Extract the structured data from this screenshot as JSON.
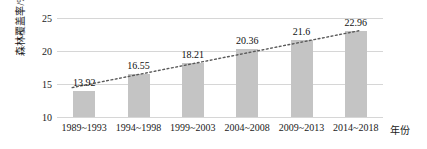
{
  "chart_data": {
    "type": "bar",
    "title": "",
    "subtitle": "",
    "xlabel": "年份",
    "ylabel": "森林覆盖率/%",
    "categories": [
      "1989~1993",
      "1994~1998",
      "1999~2003",
      "2004~2008",
      "2009~2013",
      "2014~2018"
    ],
    "values": [
      13.92,
      16.55,
      18.21,
      20.36,
      21.6,
      22.96
    ],
    "value_labels": [
      "13.92",
      "16.55",
      "18.21",
      "20.36",
      "21.6",
      "22.96"
    ],
    "ylim": [
      10,
      25
    ],
    "y_ticks": [
      10,
      15,
      20,
      25
    ],
    "y_tick_labels": [
      "10",
      "15",
      "20",
      "25"
    ],
    "grid": true,
    "legend": "none",
    "series": [
      {
        "name": "森林覆盖率",
        "type": "bar",
        "color": "#c4c4c4",
        "values": [
          13.92,
          16.55,
          18.21,
          20.36,
          21.6,
          22.96
        ]
      },
      {
        "name": "趋势线",
        "type": "line",
        "style": "dotted",
        "color": "#5a5a5a",
        "start_value": 14.45,
        "end_value": 23.1
      }
    ]
  },
  "axis": {
    "y_title": "森林覆盖率/%",
    "x_title": "年份"
  }
}
